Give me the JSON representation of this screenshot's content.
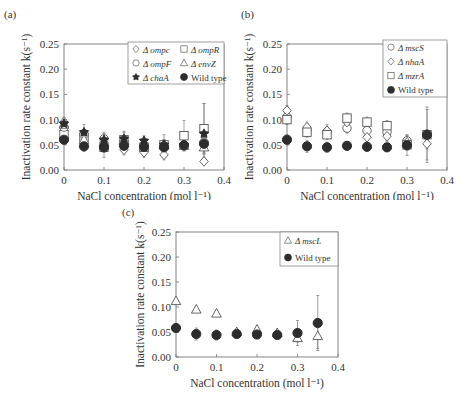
{
  "figure": {
    "panels": [
      {
        "label": "(a)"
      },
      {
        "label": "(b)"
      },
      {
        "label": "(c)"
      }
    ]
  },
  "chart_data": [
    {
      "type": "scatter",
      "panel": "(a)",
      "title": "",
      "xlabel": "NaCl concentration (mol l⁻¹)",
      "ylabel": "Inactivation rate constant k(s⁻¹)",
      "xlim": [
        0,
        0.4
      ],
      "ylim": [
        0,
        0.25
      ],
      "xticks": [
        "0",
        "0.1",
        "0.2",
        "0.3",
        "0.4"
      ],
      "yticks": [
        "0.00",
        "0.05",
        "0.10",
        "0.15",
        "0.20",
        "0.25"
      ],
      "grid": false,
      "legend_position": "upper right (2 columns)",
      "x": [
        0,
        0.05,
        0.1,
        0.15,
        0.2,
        0.25,
        0.3,
        0.35
      ],
      "series": [
        {
          "name": "Δ ompc",
          "marker": "diamond-open",
          "values": [
            0.095,
            0.06,
            0.055,
            0.04,
            0.035,
            0.03,
            null,
            0.017
          ],
          "err": [
            0.01,
            0.01,
            0.01,
            0.01,
            0.01,
            0.01,
            null,
            0.005
          ]
        },
        {
          "name": "Δ ompR",
          "marker": "square-open",
          "values": [
            0.07,
            0.065,
            0.045,
            0.06,
            0.045,
            0.05,
            0.068,
            0.082
          ],
          "err": [
            0.015,
            0.015,
            0.02,
            0.015,
            0.015,
            0.02,
            0.03,
            0.05
          ]
        },
        {
          "name": "Δ ompF",
          "marker": "circle-open",
          "values": [
            0.085,
            0.07,
            0.062,
            0.055,
            0.05,
            0.048,
            0.05,
            0.055
          ],
          "err": [
            0.01,
            0.01,
            0.01,
            0.01,
            0.01,
            0.01,
            0.01,
            0.02
          ]
        },
        {
          "name": "Δ envZ",
          "marker": "triangle-open",
          "values": [
            0.09,
            0.06,
            0.055,
            0.058,
            0.045,
            0.05,
            0.048,
            0.045
          ],
          "err": [
            0.01,
            0.01,
            0.01,
            0.01,
            0.01,
            0.01,
            0.01,
            0.02
          ]
        },
        {
          "name": "Δ chaA",
          "marker": "star-filled",
          "values": [
            0.092,
            0.075,
            0.06,
            0.062,
            0.058,
            0.05,
            0.05,
            0.072
          ],
          "err": [
            0.01,
            0.015,
            0.015,
            0.015,
            0.01,
            0.01,
            0.01,
            0.06
          ]
        },
        {
          "name": "Wild type",
          "marker": "circle-filled",
          "values": [
            0.06,
            0.047,
            0.045,
            0.048,
            0.046,
            0.045,
            0.049,
            0.052
          ],
          "err": [
            0.008,
            0.01,
            0.01,
            0.008,
            0.01,
            0.01,
            0.01,
            0.02
          ]
        }
      ]
    },
    {
      "type": "scatter",
      "panel": "(b)",
      "title": "",
      "xlabel": "NaCl concentration (mol l⁻¹)",
      "ylabel": "Inactivation rate constant k(s⁻¹)",
      "xlim": [
        0,
        0.4
      ],
      "ylim": [
        0,
        0.25
      ],
      "xticks": [
        "0",
        "0.1",
        "0.2",
        "0.3",
        "0.4"
      ],
      "yticks": [
        "0.00",
        "0.05",
        "0.10",
        "0.15",
        "0.20",
        "0.25"
      ],
      "grid": false,
      "legend_position": "upper right",
      "x": [
        0,
        0.05,
        0.1,
        0.15,
        0.2,
        0.25,
        0.3,
        0.35
      ],
      "series": [
        {
          "name": "Δ mscS",
          "marker": "circle-open",
          "values": [
            0.105,
            0.08,
            0.075,
            0.083,
            0.078,
            0.075,
            0.058,
            0.07
          ],
          "err": [
            0.01,
            0.01,
            0.01,
            0.01,
            0.01,
            0.01,
            0.01,
            0.01
          ]
        },
        {
          "name": "Δ nhaA",
          "marker": "diamond-open",
          "values": [
            0.118,
            0.085,
            0.078,
            0.095,
            0.065,
            0.067,
            0.055,
            0.052
          ],
          "err": [
            0.01,
            0.01,
            0.012,
            0.01,
            0.01,
            0.01,
            0.015,
            0.01
          ]
        },
        {
          "name": "Δ mzrA",
          "marker": "square-open",
          "values": [
            0.1,
            0.075,
            0.07,
            0.103,
            0.095,
            0.088,
            0.05,
            0.07
          ],
          "err": [
            0.01,
            0.01,
            0.01,
            0.01,
            0.01,
            0.01,
            0.01,
            0.055
          ]
        },
        {
          "name": "Wild type",
          "marker": "circle-filled",
          "values": [
            0.06,
            0.047,
            0.045,
            0.048,
            0.046,
            0.045,
            0.049,
            0.07
          ],
          "err": [
            0.01,
            0.012,
            0.01,
            0.008,
            0.008,
            0.008,
            0.02,
            0.05
          ]
        }
      ]
    },
    {
      "type": "scatter",
      "panel": "(c)",
      "title": "",
      "xlabel": "NaCl concentration (mol l⁻¹)",
      "ylabel": "Inactivation rate constant k(s⁻¹)",
      "xlim": [
        0,
        0.4
      ],
      "ylim": [
        0,
        0.25
      ],
      "xticks": [
        "0",
        "0.1",
        "0.2",
        "0.3",
        "0.4"
      ],
      "yticks": [
        "0.00",
        "0.05",
        "0.10",
        "0.15",
        "0.20",
        "0.25"
      ],
      "grid": false,
      "legend_position": "upper right",
      "x": [
        0,
        0.05,
        0.1,
        0.15,
        0.2,
        0.25,
        0.3,
        0.35
      ],
      "series": [
        {
          "name": "Δ mscL",
          "marker": "triangle-open",
          "values": [
            0.112,
            0.095,
            0.087,
            0.05,
            0.055,
            0.048,
            0.038,
            0.042
          ],
          "err": [
            0,
            0,
            0,
            0.005,
            0.005,
            0.005,
            0.008,
            0.025
          ]
        },
        {
          "name": "Wild type",
          "marker": "circle-filled",
          "values": [
            0.058,
            0.046,
            0.044,
            0.046,
            0.045,
            0.044,
            0.048,
            0.068
          ],
          "err": [
            0.005,
            0.012,
            0.01,
            0.006,
            0.008,
            0.006,
            0.025,
            0.055
          ]
        }
      ]
    }
  ]
}
